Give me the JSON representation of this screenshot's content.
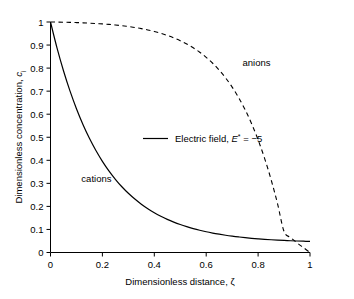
{
  "chart_data": {
    "type": "line",
    "title": "",
    "xlabel": "Dimensionless distance, ζ",
    "ylabel": "Dimensionless concentration, c",
    "ylabel_sub": "i",
    "xlim": [
      0,
      1
    ],
    "ylim": [
      0,
      1
    ],
    "grid": false,
    "xticks": [
      "0",
      "0.2",
      "0.4",
      "0.6",
      "0.8",
      "1"
    ],
    "xtick_values": [
      0,
      0.2,
      0.4,
      0.6,
      0.8,
      1
    ],
    "yticks": [
      "0",
      "0.1",
      "0.2",
      "0.3",
      "0.4",
      "0.5",
      "0.6",
      "0.7",
      "0.8",
      "0.9",
      "1"
    ],
    "ytick_values": [
      0,
      0.1,
      0.2,
      0.3,
      0.4,
      0.5,
      0.6,
      0.7,
      0.8,
      0.9,
      1
    ],
    "legend_position": "center",
    "legend_text_prefix": "Electric field, ",
    "legend_symbol": "E",
    "legend_superscript": "*",
    "legend_value": " = −5",
    "annotations": [
      {
        "name": "anions",
        "label": "anions",
        "x": 0.74,
        "y": 0.81
      },
      {
        "name": "cations",
        "label": "cations",
        "x": 0.235,
        "y": 0.305
      }
    ],
    "series": [
      {
        "name": "cations",
        "style": "solid",
        "x": [
          0,
          0.025,
          0.05,
          0.075,
          0.1,
          0.125,
          0.15,
          0.175,
          0.2,
          0.225,
          0.25,
          0.275,
          0.3,
          0.325,
          0.35,
          0.375,
          0.4,
          0.425,
          0.45,
          0.475,
          0.5,
          0.525,
          0.55,
          0.575,
          0.6,
          0.625,
          0.65,
          0.675,
          0.7,
          0.725,
          0.75,
          0.775,
          0.8,
          0.825,
          0.85,
          0.875,
          0.9,
          0.925,
          0.95,
          0.975,
          1
        ],
        "y": [
          1.0,
          0.8877,
          0.7886,
          0.7011,
          0.6239,
          0.5557,
          0.4955,
          0.4424,
          0.3955,
          0.3541,
          0.3176,
          0.2853,
          0.2569,
          0.2318,
          0.2096,
          0.19,
          0.1727,
          0.1574,
          0.1439,
          0.132,
          0.1214,
          0.1121,
          0.1038,
          0.0965,
          0.0901,
          0.0844,
          0.0794,
          0.0749,
          0.071,
          0.0675,
          0.0644,
          0.0617,
          0.0593,
          0.0572,
          0.0553,
          0.0537,
          0.0523,
          0.051,
          0.0499,
          0.049,
          0.0482
        ]
      },
      {
        "name": "anions",
        "style": "dashed",
        "x": [
          0,
          0.025,
          0.05,
          0.075,
          0.1,
          0.125,
          0.15,
          0.175,
          0.2,
          0.225,
          0.25,
          0.275,
          0.3,
          0.325,
          0.35,
          0.375,
          0.4,
          0.425,
          0.45,
          0.475,
          0.5,
          0.525,
          0.55,
          0.575,
          0.6,
          0.625,
          0.65,
          0.675,
          0.7,
          0.725,
          0.75,
          0.775,
          0.8,
          0.825,
          0.85,
          0.875,
          0.9,
          0.925,
          0.95,
          0.975,
          1
        ],
        "y": [
          1.0,
          0.9996,
          0.999,
          0.9983,
          0.9975,
          0.9964,
          0.9951,
          0.9936,
          0.9918,
          0.9896,
          0.9871,
          0.984,
          0.9804,
          0.9762,
          0.9713,
          0.9655,
          0.9588,
          0.951,
          0.9418,
          0.9312,
          0.9189,
          0.9046,
          0.888,
          0.8689,
          0.8467,
          0.8211,
          0.7914,
          0.7572,
          0.7176,
          0.672,
          0.6193,
          0.5586,
          0.4888,
          0.4086,
          0.3166,
          0.2113,
          0.0913,
          0.065,
          0.042,
          0.021,
          0.0
        ]
      }
    ]
  }
}
